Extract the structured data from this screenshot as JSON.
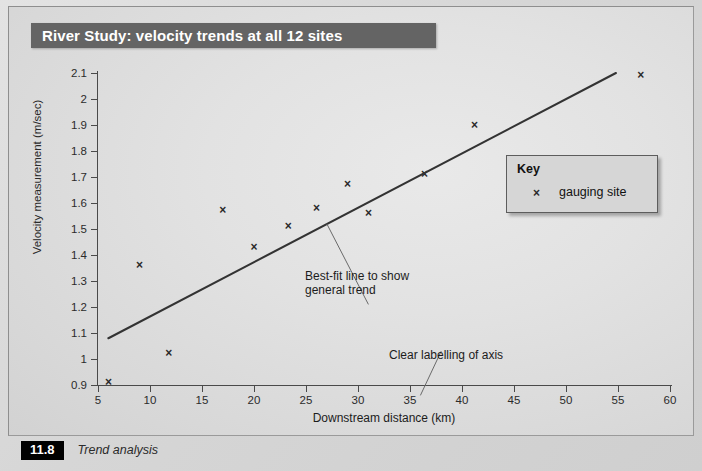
{
  "figure": {
    "title": "River Study: velocity trends at all 12 sites",
    "caption_number": "11.8",
    "caption_text": "Trend analysis"
  },
  "key": {
    "title": "Key",
    "marker_glyph": "×",
    "entry_label": "gauging site"
  },
  "annotations": {
    "bestfit": "Best-fit line to show\ngeneral trend",
    "axis": "Clear labelling of axis"
  },
  "colors": {
    "banner": "#646464",
    "panel_bg": "#e2e2e2",
    "marker": "#2a2a2a",
    "trendline": "#333333",
    "axis": "#4a4a4a"
  },
  "chart_data": {
    "type": "scatter",
    "title": "River Study: velocity trends at all 12 sites",
    "xlabel": "Downstream distance (km)",
    "ylabel": "Velocity measurement (m/sec)",
    "xlim": [
      5,
      60
    ],
    "ylim": [
      0.9,
      2.1
    ],
    "xticks": [
      5,
      10,
      15,
      20,
      25,
      30,
      35,
      40,
      45,
      50,
      55,
      60
    ],
    "xtick_labels": [
      "5",
      "10",
      "15",
      "20",
      "25",
      "30",
      "35",
      "40",
      "45",
      "50",
      "55",
      "60"
    ],
    "yticks": [
      0.9,
      1.0,
      1.1,
      1.2,
      1.3,
      1.4,
      1.5,
      1.6,
      1.7,
      1.8,
      1.9,
      2.0,
      2.1
    ],
    "ytick_labels": [
      "0.9",
      "1",
      "1.1",
      "1.2",
      "1.3",
      "1.4",
      "1.5",
      "1.6",
      "1.7",
      "1.8",
      "1.9",
      "2",
      "2.1"
    ],
    "grid": false,
    "legend_position": "right-middle",
    "series": [
      {
        "name": "gauging site",
        "marker": "x",
        "points": [
          {
            "x": 6.0,
            "y": 0.91
          },
          {
            "x": 9.0,
            "y": 1.36
          },
          {
            "x": 11.8,
            "y": 1.02
          },
          {
            "x": 17.0,
            "y": 1.57
          },
          {
            "x": 20.0,
            "y": 1.43
          },
          {
            "x": 23.3,
            "y": 1.51
          },
          {
            "x": 26.0,
            "y": 1.58
          },
          {
            "x": 29.0,
            "y": 1.67
          },
          {
            "x": 31.0,
            "y": 1.56
          },
          {
            "x": 36.4,
            "y": 1.71
          },
          {
            "x": 41.2,
            "y": 1.9
          },
          {
            "x": 57.2,
            "y": 2.09
          }
        ]
      }
    ],
    "trendline": {
      "label": "Best-fit line to show general trend",
      "x0": 6.0,
      "y0": 1.08,
      "x1": 54.8,
      "y1": 2.1
    },
    "leader_lines": [
      {
        "name": "bestfit-leader",
        "x_start": 27.0,
        "y_start": 1.52,
        "x_end": 31.0,
        "y_end": 1.21
      },
      {
        "name": "axis-leader",
        "x_start": 38.0,
        "y_start": 1.03,
        "x_end": 36.0,
        "y_end": 0.86
      }
    ]
  }
}
